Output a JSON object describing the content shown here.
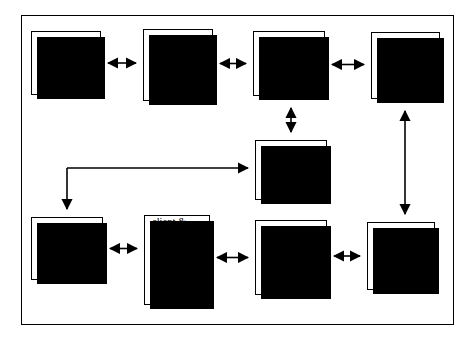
{
  "diagram": {
    "title": "",
    "frame": {
      "x": 21,
      "y": 15,
      "width": 433,
      "height": 310
    },
    "nodes": [
      {
        "id": "client-feedback",
        "label": "client\nfeedback\nabout initial\nfindings",
        "x": 31,
        "y": 31,
        "w": 70,
        "h": 64,
        "align": "left"
      },
      {
        "id": "evaluator-edits",
        "label": "evaluator\nedits &\nrepresents\npossible\nalternatives",
        "x": 143,
        "y": 29,
        "w": 70,
        "h": 72,
        "align": "left"
      },
      {
        "id": "evaluator-rates",
        "label": "evaluator\nrates or\nprioritizes\nalternatives",
        "x": 253,
        "y": 31,
        "w": 72,
        "h": 65,
        "align": "left"
      },
      {
        "id": "move-to-phase-4",
        "label": "move to\nPhase 4",
        "x": 371,
        "y": 32,
        "w": 69,
        "h": 67,
        "align": "center"
      },
      {
        "id": "evaluator-makes-recommendations",
        "label": "evaluator\nmakes\nrecommen-\ndations",
        "x": 255,
        "y": 140,
        "w": 72,
        "h": 60,
        "align": "left"
      },
      {
        "id": "client-reacts",
        "label": "client reacts\nto\nrecommen-\ndations",
        "x": 31,
        "y": 217,
        "w": 72,
        "h": 63,
        "align": "left"
      },
      {
        "id": "client-evaluator-represent",
        "label": "client &\nevaluator\nrepresent\ndecisions as\nvalue,\ntrajectory &\nstrategic",
        "x": 144,
        "y": 215,
        "w": 66,
        "h": 90,
        "align": "left"
      },
      {
        "id": "client-evaluator-rate",
        "label": "client &\nevaluator\nrate\nrecommen-\ndations",
        "x": 255,
        "y": 220,
        "w": 72,
        "h": 75,
        "align": "left"
      },
      {
        "id": "evaluator-presents",
        "label": "evaluator\npresents\ndelivery\nplan",
        "x": 367,
        "y": 222,
        "w": 68,
        "h": 68,
        "align": "left"
      }
    ],
    "edges": [
      {
        "id": "client-feedback-to-evaluator-edits",
        "kind": "double-horizontal",
        "from": "client-feedback",
        "to": "evaluator-edits"
      },
      {
        "id": "evaluator-edits-to-evaluator-rates",
        "kind": "double-horizontal",
        "from": "evaluator-edits",
        "to": "evaluator-rates"
      },
      {
        "id": "evaluator-rates-to-move-to-phase-4",
        "kind": "double-horizontal",
        "from": "evaluator-rates",
        "to": "move-to-phase-4"
      },
      {
        "id": "evaluator-rates-to-evaluator-makes",
        "kind": "double-vertical",
        "from": "evaluator-rates",
        "to": "evaluator-makes-recommendations"
      },
      {
        "id": "move-to-phase-4-to-evaluator-presents",
        "kind": "double-vertical",
        "from": "move-to-phase-4",
        "to": "evaluator-presents"
      },
      {
        "id": "elbow-to-evaluator-makes-and-client-reacts",
        "kind": "elbow-split",
        "to": "evaluator-makes-recommendations",
        "to2": "client-reacts"
      },
      {
        "id": "client-reacts-to-client-evaluator-represent",
        "kind": "double-horizontal",
        "from": "client-reacts",
        "to": "client-evaluator-represent"
      },
      {
        "id": "client-evaluator-represent-to-client-evaluator-rate",
        "kind": "double-horizontal",
        "from": "client-evaluator-represent",
        "to": "client-evaluator-rate"
      },
      {
        "id": "client-evaluator-rate-to-evaluator-presents",
        "kind": "double-horizontal",
        "from": "client-evaluator-rate",
        "to": "evaluator-presents"
      }
    ],
    "colors": {
      "stroke": "#000000",
      "node_fill": "#ffffff",
      "shadow": "#000000",
      "background": "#ffffff"
    }
  }
}
